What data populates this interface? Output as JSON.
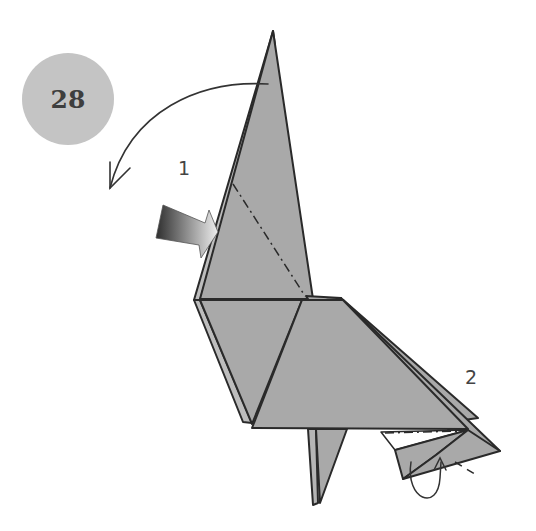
{
  "step": {
    "number": "28"
  },
  "annotations": [
    {
      "id": "1",
      "label": "1"
    },
    {
      "id": "2",
      "label": "2"
    }
  ],
  "colors": {
    "paper": "#a9a9a9",
    "paper_light": "#b5b5b5",
    "stroke": "#2a2a2a",
    "badge": "#c4c4c4",
    "badge_text": "#3e3e3e"
  }
}
